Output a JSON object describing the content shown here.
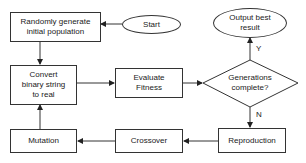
{
  "diagram": {
    "type": "flowchart",
    "nodes": {
      "start": {
        "label": "Start",
        "shape": "ellipse"
      },
      "init": {
        "label": "Randomly generate initial population",
        "line1": "Randomly generate",
        "line2": "initial population",
        "shape": "rect"
      },
      "convert": {
        "label": "Convert binary string to real",
        "line1": "Convert",
        "line2": "binary string",
        "line3": "to real",
        "shape": "rect"
      },
      "evaluate": {
        "label": "Evaluate Fitness",
        "line1": "Evaluate",
        "line2": "Fitness",
        "shape": "rect"
      },
      "decision": {
        "label": "Generations complete?",
        "line1": "Generations",
        "line2": "complete?",
        "shape": "diamond"
      },
      "output": {
        "label": "Output best result",
        "line1": "Output best",
        "line2": "result",
        "shape": "ellipse"
      },
      "reproduction": {
        "label": "Reproduction",
        "shape": "rect"
      },
      "crossover": {
        "label": "Crossover",
        "shape": "rect"
      },
      "mutation": {
        "label": "Mutation",
        "shape": "rect"
      }
    },
    "edges": [
      {
        "from": "start",
        "to": "init",
        "label": ""
      },
      {
        "from": "init",
        "to": "convert",
        "label": ""
      },
      {
        "from": "convert",
        "to": "evaluate",
        "label": ""
      },
      {
        "from": "evaluate",
        "to": "decision",
        "label": ""
      },
      {
        "from": "decision",
        "to": "output",
        "label": "Y"
      },
      {
        "from": "decision",
        "to": "reproduction",
        "label": "N"
      },
      {
        "from": "reproduction",
        "to": "crossover",
        "label": ""
      },
      {
        "from": "crossover",
        "to": "mutation",
        "label": ""
      },
      {
        "from": "mutation",
        "to": "convert",
        "label": ""
      }
    ],
    "edge_labels": {
      "yes": "Y",
      "no": "N"
    },
    "colors": {
      "stroke": "#333333",
      "fill": "#ffffff",
      "text": "#1a1a1a"
    }
  }
}
